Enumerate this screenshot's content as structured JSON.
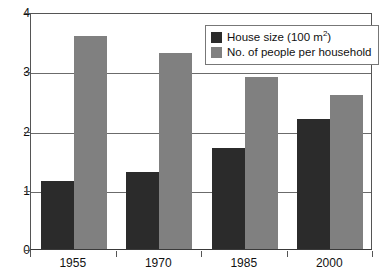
{
  "chart_data": {
    "type": "bar",
    "title": "",
    "subtitle": "",
    "xlabel": "",
    "ylabel": "",
    "categories": [
      "1955",
      "1970",
      "1985",
      "2000"
    ],
    "series": [
      {
        "name": "House size (100 m²)",
        "name_base": "House size (100 m",
        "name_sup": "2",
        "name_tail": ")",
        "color": "#2b2b2b",
        "values": [
          1.15,
          1.3,
          1.7,
          2.2
        ]
      },
      {
        "name": "No. of people per household",
        "color": "#808080",
        "values": [
          3.6,
          3.3,
          2.9,
          2.6
        ]
      }
    ],
    "ylim": [
      0,
      4
    ],
    "ytick_labels": [
      "0",
      "1",
      "2",
      "3",
      "4"
    ],
    "ytick_values": [
      0,
      1,
      2,
      3,
      4
    ],
    "grid": true,
    "gridline_values": [
      1,
      2,
      3,
      4
    ],
    "legend_position": "top-right-inside",
    "axis_color": "#555555",
    "gridline_color": "#6b6b6b",
    "background": "#ffffff"
  },
  "legend": {
    "entries": [
      {
        "label": "House size (100 m2)"
      },
      {
        "label": "No. of people per household"
      }
    ]
  }
}
